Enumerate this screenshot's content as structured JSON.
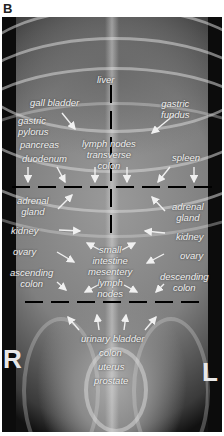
{
  "panel_letter": "B",
  "image": {
    "description": "Ventrodorsal abdominal radiograph of a dog divided into regions by dashed lines",
    "side_markers": {
      "right": "R",
      "left": "L"
    }
  },
  "labels": {
    "liver": "liver",
    "gall_bladder": "gall bladder",
    "gastric_fundus": "gastric\nfundus",
    "gastric_pylorus": "gastric\npylorus",
    "pancreas": "pancreas",
    "duodenum": "duodenum",
    "lymph_nodes_transverse_colon": "lymph nodes\ntransverse\ncolon",
    "spleen": "spleen",
    "adrenal_gland_right": "adrenal\ngland",
    "adrenal_gland_left": "adrenal\ngland",
    "kidney_right": "kidney",
    "kidney_left": "kidney",
    "ovary_right": "ovary",
    "ovary_left": "ovary",
    "ascending_colon": "ascending\ncolon",
    "descending_colon": "descending\ncolon",
    "small_intestine_mesentery_lymph_nodes": "small\nintestine\nmesentery\nlymph\nnodes",
    "urinary_bladder": "urinary bladder",
    "colon": "colon",
    "uterus": "uterus",
    "prostate": "prostate"
  },
  "regions": {
    "dividers": [
      {
        "type": "horizontal-dashed",
        "y_px": 187
      },
      {
        "type": "horizontal-dashed",
        "y_px": 302
      },
      {
        "type": "vertical-dashed",
        "x_px": 111,
        "from_y_px": 85,
        "to_y_px": 238
      }
    ]
  }
}
